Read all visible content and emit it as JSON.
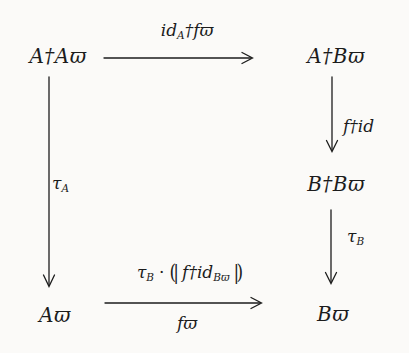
{
  "figure": {
    "kind": "commutative-diagram",
    "background": "#fbfaf8",
    "ink": "#1c1c1c"
  },
  "nodes": {
    "top_left": "A†Aϖ",
    "top_right": "A†Bϖ",
    "mid_right": "B†Bϖ",
    "bottom_left": "Aϖ",
    "bottom_right": "Bϖ"
  },
  "labels": {
    "top": {
      "main": "id",
      "sub": "A",
      "rest": "†fϖ"
    },
    "left": {
      "main": "τ",
      "sub": "A"
    },
    "right_upper": {
      "text": "f†id"
    },
    "right_lower": {
      "main": "τ",
      "sub": "B"
    },
    "bottom_above": {
      "tau": "τ",
      "tau_sub": "B",
      "dot": "·",
      "open": "(|",
      "body": "f†id",
      "body_sub": "Bϖ",
      "close": "|)"
    },
    "bottom_below": {
      "text": "fϖ"
    }
  }
}
